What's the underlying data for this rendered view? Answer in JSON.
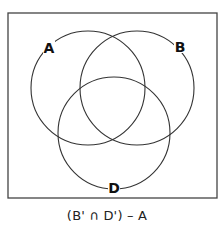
{
  "diagram": {
    "type": "venn",
    "universe": {
      "x": 8,
      "y": 13,
      "width": 209,
      "height": 185,
      "stroke": "#444444"
    },
    "sets": [
      {
        "name": "A",
        "label": "A",
        "cx": 88,
        "cy": 88,
        "r": 57,
        "label_x": 49,
        "label_y": 53
      },
      {
        "name": "B",
        "label": "B",
        "cx": 137,
        "cy": 88,
        "r": 57,
        "label_x": 180,
        "label_y": 52
      },
      {
        "name": "D",
        "label": "D",
        "cx": 114,
        "cy": 133,
        "r": 56,
        "label_x": 114,
        "label_y": 193
      }
    ],
    "stroke_color": "#333333",
    "caption": "(B' ∩ D') – A"
  }
}
